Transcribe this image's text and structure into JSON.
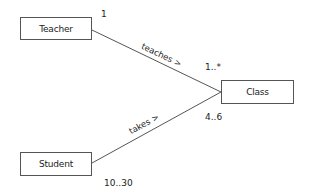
{
  "diagram": {
    "type": "uml-class-association",
    "classes": [
      {
        "id": "teacher",
        "label": "Teacher"
      },
      {
        "id": "class",
        "label": "Class"
      },
      {
        "id": "student",
        "label": "Student"
      }
    ],
    "associations": [
      {
        "from": "teacher",
        "to": "class",
        "label": "teaches >",
        "from_multiplicity": "1",
        "to_multiplicity": "1..*"
      },
      {
        "from": "student",
        "to": "class",
        "label": "takes >",
        "from_multiplicity": "10..30",
        "to_multiplicity": "4..6"
      }
    ],
    "colors": {
      "line": "#555555",
      "text": "#222222",
      "background": "#ffffff"
    }
  }
}
